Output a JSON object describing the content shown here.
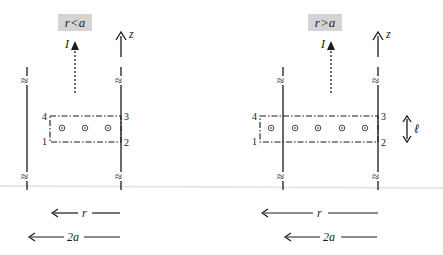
{
  "panels": [
    {
      "id": "left",
      "badge": "r<a",
      "current_label": "I",
      "axis_label": "z",
      "corners": {
        "c1": "1",
        "c2": "2",
        "c3": "3",
        "c4": "4"
      },
      "dot_count": 3,
      "dim_r": "r",
      "dim_2a": "2a"
    },
    {
      "id": "right",
      "badge": "r>a",
      "current_label": "I",
      "axis_label": "z",
      "corners": {
        "c1": "1",
        "c2": "2",
        "c3": "3",
        "c4": "4"
      },
      "dot_count": 5,
      "length_label": "ℓ",
      "dim_r": "r",
      "dim_2a": "2a"
    }
  ],
  "colors": {
    "ink": "#1a1a1a",
    "badge_bg": "#d4d4d4",
    "separator": "#e6e6e6"
  },
  "icons": {
    "break_mark": "≈",
    "field_out_of_page": "⊙"
  }
}
